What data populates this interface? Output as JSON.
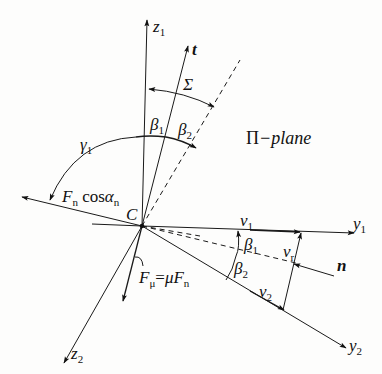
{
  "diagram": {
    "plane_label_prefix": "Π",
    "plane_label_suffix": "−plane",
    "origin_label": "C",
    "axes": {
      "z1": {
        "base": "z",
        "sub": "1"
      },
      "z2": {
        "base": "z",
        "sub": "2"
      },
      "y1": {
        "base": "y",
        "sub": "1"
      },
      "y2": {
        "base": "y",
        "sub": "2"
      },
      "t": {
        "base": "t"
      },
      "n": {
        "base": "n"
      }
    },
    "angles": {
      "beta1": {
        "base": "β",
        "sub": "1"
      },
      "beta2": {
        "base": "β",
        "sub": "2"
      },
      "gamma1": {
        "base": "γ",
        "sub": "1"
      },
      "sigma": {
        "base": "Σ"
      }
    },
    "velocities": {
      "v1": {
        "base": "v",
        "sub": "1"
      },
      "v2": {
        "base": "v",
        "sub": "2"
      },
      "vr": {
        "base": "v",
        "sub": "r"
      }
    },
    "forces": {
      "normal_component": {
        "F": "F",
        "Fsub": "n",
        "cos": " cos",
        "alpha": "α",
        "alphasub": "n"
      },
      "friction": {
        "F": "F",
        "Fsub": "μ",
        "eq": "=",
        "mu": "μ",
        "F2": "F",
        "F2sub": "n"
      }
    }
  }
}
